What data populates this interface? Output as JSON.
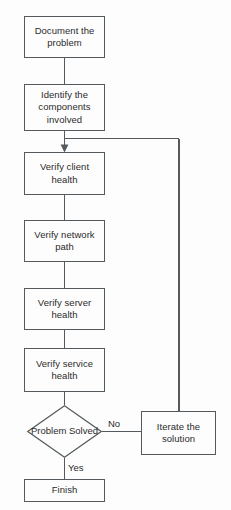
{
  "diagram": {
    "stroke_color": "#555a5e",
    "text_color": "#2b2b2b",
    "background_color": "#fdfdfd",
    "nodes": [
      {
        "id": "document",
        "shape": "process",
        "label": "Document the problem"
      },
      {
        "id": "identify",
        "shape": "process",
        "label": "Identify the components involved"
      },
      {
        "id": "client",
        "shape": "process",
        "label": "Verify client health"
      },
      {
        "id": "network",
        "shape": "process",
        "label": "Verify network path"
      },
      {
        "id": "server",
        "shape": "process",
        "label": "Verify server health"
      },
      {
        "id": "service",
        "shape": "process",
        "label": "Verify service health"
      },
      {
        "id": "decision",
        "shape": "decision",
        "label": "Problem Solved"
      },
      {
        "id": "iterate",
        "shape": "process",
        "label": "Iterate the solution"
      },
      {
        "id": "finish",
        "shape": "terminal",
        "label": "Finish"
      }
    ],
    "edge_labels": {
      "no": "No",
      "yes": "Yes"
    }
  }
}
